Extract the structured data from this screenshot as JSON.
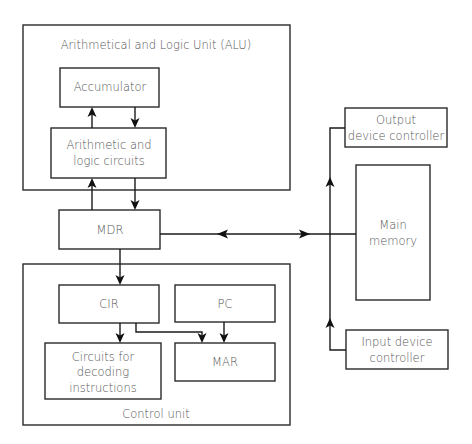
{
  "diagram": {
    "alu": {
      "label": "Arithmetical and Logic Unit (ALU)"
    },
    "accumulator": {
      "label": "Accumulator"
    },
    "alc": {
      "line1": "Arithmetic and",
      "line2": "logic circuits"
    },
    "mdr": {
      "label": "MDR"
    },
    "control_unit": {
      "label": "Control unit"
    },
    "cir": {
      "label": "CIR"
    },
    "pc": {
      "label": "PC"
    },
    "mar": {
      "label": "MAR"
    },
    "decoder": {
      "line1": "Circuits for",
      "line2": "decoding",
      "line3": "instructions"
    },
    "output_controller": {
      "line1": "Output",
      "line2": "device controller"
    },
    "main_memory": {
      "line1": "Main",
      "line2": "memory"
    },
    "input_controller": {
      "line1": "Input device",
      "line2": "controller"
    },
    "connections": [
      {
        "from": "Arithmetic and logic circuits",
        "to": "Accumulator"
      },
      {
        "from": "Accumulator",
        "to": "Arithmetic and logic circuits"
      },
      {
        "from": "MDR",
        "to": "Arithmetic and logic circuits"
      },
      {
        "from": "Arithmetic and logic circuits",
        "to": "MDR"
      },
      {
        "from": "MDR",
        "to": "CIR"
      },
      {
        "from": "CIR",
        "to": "Circuits for decoding instructions"
      },
      {
        "from": "CIR",
        "to": "MAR"
      },
      {
        "from": "PC",
        "to": "MAR"
      },
      {
        "from": "MDR",
        "to": "Main memory",
        "bidirectional": true
      },
      {
        "from": "Input device controller",
        "to": "Output device controller"
      }
    ]
  }
}
